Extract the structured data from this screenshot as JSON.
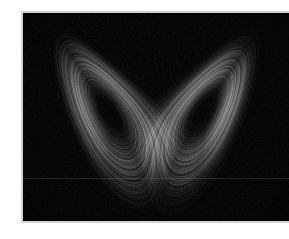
{
  "figure": {
    "type": "phase-portrait",
    "background_color": "#ffffff",
    "plot_background_color": "#050505",
    "frame_border_color": "#d2d2d2",
    "trace_color": "#ffffff",
    "artifact_line_color": "#969696"
  },
  "chart_data": {
    "type": "line",
    "xlabel": "",
    "ylabel": "",
    "projection": "x-z",
    "grid": false,
    "legend": null,
    "tick_labels_x": [],
    "tick_labels_y": [],
    "xlim": [
      -24,
      24
    ],
    "ylim": [
      2,
      50
    ],
    "system": {
      "name": "Lorenz system",
      "equations": [
        "dx/dt = sigma * (y - x)",
        "dy/dt = x * (rho - z) - y",
        "dz/dt = x * y - beta * z"
      ],
      "parameters": {
        "sigma": 10,
        "rho": 28,
        "beta": 2.6666667
      },
      "initial_state": {
        "x": 0.9,
        "y": 1.7,
        "z": 22.0
      },
      "dt": 0.0032,
      "steps": 260000,
      "burn_in": 900
    },
    "render": {
      "point_alpha": 0.055,
      "line_width": 0.55,
      "noise_amplitude": 0.035,
      "noise_density": 0.34
    },
    "features": [
      {
        "name": "left-lobe-center",
        "x": -8.0,
        "y": 27.0
      },
      {
        "name": "right-lobe-center",
        "x": 8.5,
        "y": 27.5
      },
      {
        "name": "crossing-region",
        "x": 0.5,
        "y": 24.0
      }
    ]
  },
  "artifact": {
    "scanline_y_fraction": 0.793
  }
}
